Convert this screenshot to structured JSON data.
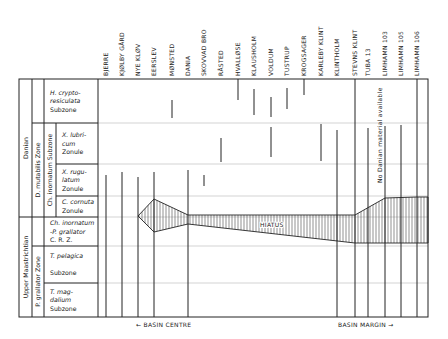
{
  "frame": {
    "left": 19,
    "right": 428,
    "top": 79,
    "bottom": 317,
    "label_right": 98
  },
  "colors": {
    "line": "#222222",
    "grid": "#c8c8c8",
    "hatch": "#444444",
    "bg": "#ffffff"
  },
  "localities": [
    {
      "name": "BJERRE",
      "x": 106
    },
    {
      "name": "KJØLBY GÅRD",
      "x": 122
    },
    {
      "name": "NYE KLØV",
      "x": 138
    },
    {
      "name": "EERSLEV",
      "x": 154
    },
    {
      "name": "MØNSTED",
      "x": 172
    },
    {
      "name": "DANIA",
      "x": 188
    },
    {
      "name": "SKOVVAD BRO",
      "x": 204
    },
    {
      "name": "RÅSTED",
      "x": 221
    },
    {
      "name": "HVALLØSE",
      "x": 238
    },
    {
      "name": "KLAUSHOLM",
      "x": 254
    },
    {
      "name": "VOLDUM",
      "x": 271
    },
    {
      "name": "TUSTRUP",
      "x": 287
    },
    {
      "name": "KROGSAGER",
      "x": 304
    },
    {
      "name": "KARLEBY KLINT",
      "x": 321
    },
    {
      "name": "KLINTHOLM",
      "x": 337
    },
    {
      "name": "STEVNS KLINT",
      "x": 355
    },
    {
      "name": "TUBA 13",
      "x": 368
    },
    {
      "name": "LIMHAMN 103",
      "x": 385
    },
    {
      "name": "LIMHAMN 105",
      "x": 401
    },
    {
      "name": "LIMHAMN 106",
      "x": 417
    }
  ],
  "stages": [
    {
      "label": "Danian",
      "y1": 79,
      "y2": 217
    },
    {
      "label": "Upper Maastrichtian",
      "y1": 217,
      "y2": 317
    }
  ],
  "zones": [
    {
      "label": "D. mutabilis  Zone",
      "y1": 123,
      "y2": 217
    },
    {
      "label": "P. grallator  Zone",
      "y1": 246,
      "y2": 317
    }
  ],
  "subzone_bands": [
    {
      "label": "Ch. inornatum  Subzone",
      "y1": 123,
      "y2": 217
    }
  ],
  "units": [
    {
      "lines": [
        "H. crypto-",
        "resiculata",
        "Subzone"
      ],
      "italic": [
        true,
        true,
        false
      ],
      "y1": 79,
      "y2": 123,
      "x": 47
    },
    {
      "lines": [
        "X. lubri-",
        "cum",
        "Zonule"
      ],
      "italic": [
        true,
        true,
        false
      ],
      "y1": 123,
      "y2": 164,
      "x": 59
    },
    {
      "lines": [
        "X. rugu-",
        "latum",
        "Zonule"
      ],
      "italic": [
        true,
        true,
        false
      ],
      "y1": 164,
      "y2": 196,
      "x": 59
    },
    {
      "lines": [
        "C. cornuta",
        "Zonule"
      ],
      "italic": [
        true,
        false
      ],
      "y1": 196,
      "y2": 217,
      "x": 59
    },
    {
      "lines": [
        "Ch. inornatum",
        "-P. grallator",
        "C. R. Z."
      ],
      "italic": [
        true,
        true,
        false
      ],
      "y1": 217,
      "y2": 246,
      "x": 47
    },
    {
      "lines": [
        "T. pelagica",
        "",
        "Subzone"
      ],
      "italic": [
        true,
        false,
        false
      ],
      "y1": 246,
      "y2": 283,
      "x": 47
    },
    {
      "lines": [
        "T. mag-",
        "dalium",
        "Subzone"
      ],
      "italic": [
        true,
        true,
        false
      ],
      "y1": 283,
      "y2": 317,
      "x": 47
    }
  ],
  "grid_rows": [
    123,
    164,
    196,
    217,
    246,
    283
  ],
  "ranges": [
    {
      "x": 106,
      "y1": 175,
      "y2": 317
    },
    {
      "x": 122,
      "y1": 172,
      "y2": 317
    },
    {
      "x": 138,
      "y1": 177,
      "y2": 317
    },
    {
      "x": 154,
      "y1": 172,
      "y2": 317
    },
    {
      "x": 172,
      "y1": 100,
      "y2": 118
    },
    {
      "x": 188,
      "y1": 170,
      "y2": 317
    },
    {
      "x": 204,
      "y1": 175,
      "y2": 186
    },
    {
      "x": 221,
      "y1": 138,
      "y2": 162
    },
    {
      "x": 238,
      "y1": 79,
      "y2": 100
    },
    {
      "x": 254,
      "y1": 89,
      "y2": 115
    },
    {
      "x": 271,
      "y1": 97,
      "y2": 117
    },
    {
      "x": 287,
      "y1": 88,
      "y2": 109
    },
    {
      "x": 304,
      "y1": 79,
      "y2": 95
    },
    {
      "x": 271,
      "y1": 127,
      "y2": 157
    },
    {
      "x": 321,
      "y1": 124,
      "y2": 161
    },
    {
      "x": 337,
      "y1": 130,
      "y2": 317
    },
    {
      "x": 355,
      "y1": 79,
      "y2": 317
    },
    {
      "x": 368,
      "y1": 128,
      "y2": 317
    },
    {
      "x": 385,
      "y1": 126,
      "y2": 317
    },
    {
      "x": 401,
      "y1": 125,
      "y2": 317
    },
    {
      "x": 417,
      "y1": 79,
      "y2": 317
    }
  ],
  "hiatus": {
    "label": "HIATUS",
    "label_x": 260,
    "label_y": 227,
    "top": [
      [
        138,
        216
      ],
      [
        154,
        199
      ],
      [
        188,
        215
      ],
      [
        355,
        215
      ],
      [
        385,
        198
      ],
      [
        417,
        197
      ],
      [
        428,
        197
      ]
    ],
    "bottom": [
      [
        428,
        243
      ],
      [
        417,
        243
      ],
      [
        385,
        243
      ],
      [
        355,
        243
      ],
      [
        188,
        224
      ],
      [
        154,
        232
      ],
      [
        138,
        216
      ]
    ]
  },
  "no_danian_note": {
    "text": "No Danian material available",
    "x": 382,
    "y": 183
  },
  "footer": {
    "basin_centre": "← BASIN  CENTRE",
    "basin_margin": "BASIN  MARGIN →"
  }
}
